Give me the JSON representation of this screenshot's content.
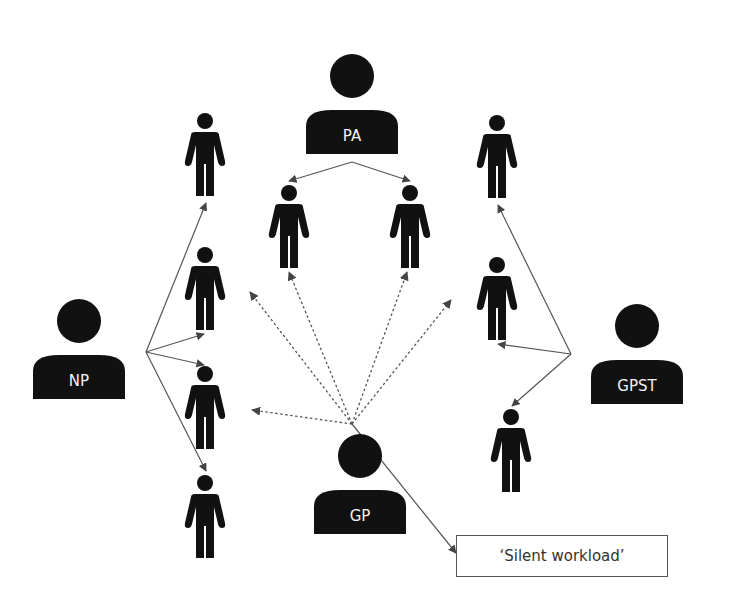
{
  "diagram": {
    "title": "",
    "colors": {
      "figure": "#111111",
      "line": "#555555",
      "label": "#f2f2f2",
      "box_border": "#555555"
    },
    "roles": [
      {
        "id": "PA",
        "label": "PA",
        "cx": 352,
        "cy": 105
      },
      {
        "id": "NP",
        "label": "NP",
        "cx": 79,
        "cy": 350
      },
      {
        "id": "GPST",
        "label": "GPST",
        "cx": 637,
        "cy": 355
      },
      {
        "id": "GP",
        "label": "GP",
        "cx": 360,
        "cy": 485
      }
    ],
    "patients": [
      {
        "id": "p1",
        "x": 205,
        "y": 113
      },
      {
        "id": "p2",
        "x": 205,
        "y": 247
      },
      {
        "id": "p3",
        "x": 205,
        "y": 366
      },
      {
        "id": "p4",
        "x": 205,
        "y": 475
      },
      {
        "id": "p5",
        "x": 289,
        "y": 185
      },
      {
        "id": "p6",
        "x": 410,
        "y": 185
      },
      {
        "id": "p7",
        "x": 497,
        "y": 115
      },
      {
        "id": "p8",
        "x": 497,
        "y": 257
      },
      {
        "id": "p9",
        "x": 511,
        "y": 409
      }
    ],
    "edges": [
      {
        "from": "PA",
        "x1": 352,
        "y1": 162,
        "x2": 289,
        "y2": 181,
        "style": "solid"
      },
      {
        "from": "PA",
        "x1": 352,
        "y1": 162,
        "x2": 410,
        "y2": 181,
        "style": "solid"
      },
      {
        "from": "NP",
        "x1": 146,
        "y1": 352,
        "x2": 206,
        "y2": 203,
        "style": "solid"
      },
      {
        "from": "NP",
        "x1": 146,
        "y1": 352,
        "x2": 204,
        "y2": 334,
        "style": "solid"
      },
      {
        "from": "NP",
        "x1": 146,
        "y1": 352,
        "x2": 204,
        "y2": 365,
        "style": "solid"
      },
      {
        "from": "NP",
        "x1": 146,
        "y1": 352,
        "x2": 206,
        "y2": 471,
        "style": "solid"
      },
      {
        "from": "GPST",
        "x1": 571,
        "y1": 354,
        "x2": 498,
        "y2": 205,
        "style": "solid"
      },
      {
        "from": "GPST",
        "x1": 571,
        "y1": 354,
        "x2": 498,
        "y2": 344,
        "style": "solid"
      },
      {
        "from": "GPST",
        "x1": 571,
        "y1": 354,
        "x2": 512,
        "y2": 406,
        "style": "solid"
      },
      {
        "from": "GP",
        "x1": 352,
        "y1": 424,
        "x2": 250,
        "y2": 292,
        "style": "dotted"
      },
      {
        "from": "GP",
        "x1": 352,
        "y1": 424,
        "x2": 289,
        "y2": 272,
        "style": "dotted"
      },
      {
        "from": "GP",
        "x1": 352,
        "y1": 424,
        "x2": 407,
        "y2": 272,
        "style": "dotted"
      },
      {
        "from": "GP",
        "x1": 352,
        "y1": 424,
        "x2": 451,
        "y2": 300,
        "style": "dotted"
      },
      {
        "from": "GP",
        "x1": 352,
        "y1": 424,
        "x2": 252,
        "y2": 410,
        "style": "dotted"
      },
      {
        "from": "GP",
        "x1": 352,
        "y1": 424,
        "x2": 456,
        "y2": 553,
        "style": "solid"
      }
    ],
    "note": {
      "label": "‘Silent workload’"
    }
  }
}
